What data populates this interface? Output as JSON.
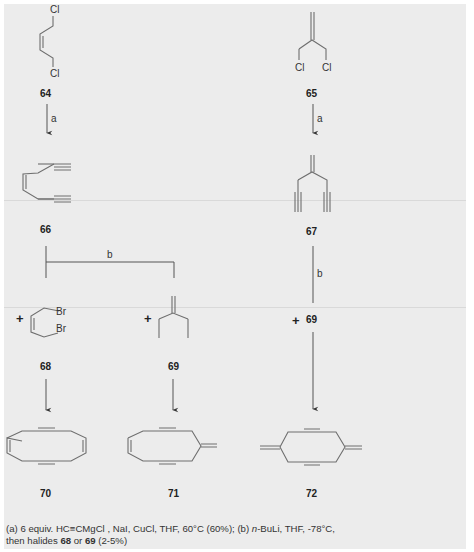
{
  "scheme": {
    "compounds": [
      {
        "id": "64",
        "name": "cis-1,4-dichloro-2-butene",
        "atoms": [
          "Cl",
          "Cl"
        ]
      },
      {
        "id": "65",
        "name": "3-chloro-2-(chloromethyl)propene",
        "atoms": [
          "Cl",
          "Cl"
        ]
      },
      {
        "id": "66",
        "name": "cis-diyne-ene"
      },
      {
        "id": "67",
        "name": "methylene diyne"
      },
      {
        "id": "68",
        "name": "cis-1,4-dibromo-2-butene",
        "atoms": [
          "Br",
          "Br"
        ]
      },
      {
        "id": "69",
        "name": "3-iodo-2-(iodomethyl)propene",
        "atoms": [
          "I",
          "I"
        ]
      },
      {
        "id": "70",
        "name": "cyclic tetraene-diyne"
      },
      {
        "id": "71",
        "name": "cyclic methylene diyne"
      },
      {
        "id": "72",
        "name": "cyclic bis-methylene diyne"
      }
    ],
    "arrows": [
      {
        "from": "64",
        "to": "66",
        "label": "a"
      },
      {
        "from": "65",
        "to": "67",
        "label": "a"
      },
      {
        "from": "66",
        "to": "70/71",
        "label": "b"
      },
      {
        "from": "67",
        "to": "72",
        "label": "b"
      }
    ],
    "plus": "+",
    "reagent_inline": "69",
    "labels": {
      "c64": "64",
      "c65": "65",
      "c66": "66",
      "c67": "67",
      "c68": "68",
      "c69": "69",
      "c69b": "69",
      "c70": "70",
      "c71": "71",
      "c72": "72",
      "a1": "a",
      "a2": "a",
      "b1": "b",
      "b2": "b",
      "cl": "Cl",
      "br": "Br",
      "i": "I"
    }
  },
  "caption": {
    "line1_pre": "(a) 6 equiv. HC",
    "triple": "≡",
    "line1_mid": "CMgCl , NaI, CuCl, THF, 60°C (60%); (b) ",
    "nBu": "n",
    "line1_post": "-BuLi, THF, -78°C,",
    "line2_pre": "then halides ",
    "h1": "68",
    "or": " or ",
    "h2": "69",
    "line2_post": " (2-5%)"
  }
}
